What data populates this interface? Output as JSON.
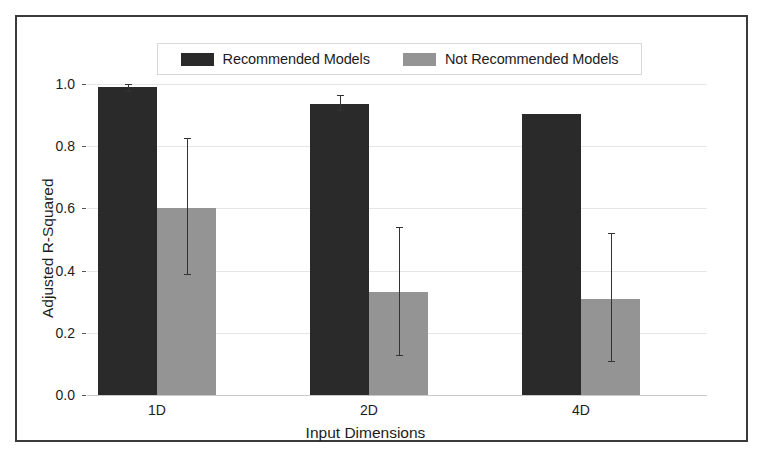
{
  "figure": {
    "background_color": "#ffffff",
    "frame_color": "#3a3a3a"
  },
  "legend": {
    "position": "upper-center",
    "entries": [
      {
        "label": "Recommended Models",
        "color": "#2a2a2a",
        "swatch_name": "legend-swatch-recommended"
      },
      {
        "label": "Not Recommended Models",
        "color": "#949494",
        "swatch_name": "legend-swatch-not-recommended"
      }
    ]
  },
  "axes": {
    "ylabel": "Adjusted R-Squared",
    "xlabel": "Input Dimensions",
    "yticks": [
      "0.0",
      "0.2",
      "0.4",
      "0.6",
      "0.8",
      "1.0"
    ],
    "xticks": [
      "1D",
      "2D",
      "4D"
    ],
    "ylim": [
      0.0,
      1.0
    ],
    "grid": "horizontal"
  },
  "chart_data": {
    "type": "bar",
    "title": "",
    "xlabel": "Input Dimensions",
    "ylabel": "Adjusted R-Squared",
    "ylim": [
      0.0,
      1.0
    ],
    "yticks": [
      0.0,
      0.2,
      0.4,
      0.6,
      0.8,
      1.0
    ],
    "grid": true,
    "legend_position": "upper center",
    "categories": [
      "1D",
      "2D",
      "4D"
    ],
    "series": [
      {
        "name": "Recommended Models",
        "color": "#2a2a2a",
        "values": [
          0.99,
          0.935,
          0.905
        ],
        "error_low": [
          0.977,
          0.915,
          null
        ],
        "error_high": [
          1.005,
          0.965,
          null
        ]
      },
      {
        "name": "Not Recommended Models",
        "color": "#949494",
        "values": [
          0.6,
          0.33,
          0.31
        ],
        "error_low": [
          0.39,
          0.13,
          0.11
        ],
        "error_high": [
          0.826,
          0.54,
          0.52
        ]
      }
    ]
  }
}
